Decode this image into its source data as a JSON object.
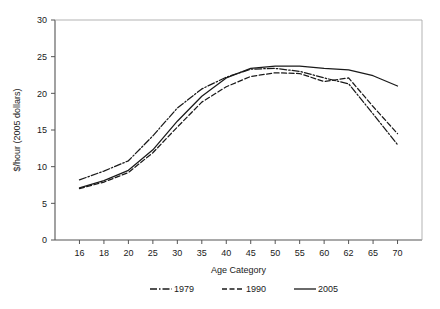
{
  "chart_data": {
    "type": "line",
    "title": "",
    "xlabel": "Age Category",
    "ylabel": "$/hour (2005 dollars)",
    "categories": [
      "16",
      "18",
      "20",
      "25",
      "30",
      "35",
      "40",
      "45",
      "50",
      "55",
      "60",
      "62",
      "65",
      "70"
    ],
    "ylim": [
      0,
      30
    ],
    "yticks": [
      "0",
      "5",
      "10",
      "15",
      "20",
      "25",
      "30"
    ],
    "grid": false,
    "legend_position": "bottom",
    "series": [
      {
        "name": "1979",
        "style": "dash-dot",
        "color": "#1a1a1a",
        "values": [
          8.2,
          9.4,
          10.8,
          14.2,
          18.0,
          20.6,
          22.2,
          23.3,
          23.4,
          23.0,
          22.1,
          21.3,
          17.2,
          13.0
        ]
      },
      {
        "name": "1990",
        "style": "dashed",
        "color": "#1a1a1a",
        "values": [
          7.0,
          7.9,
          9.2,
          11.9,
          15.4,
          18.8,
          20.9,
          22.3,
          22.8,
          22.7,
          21.6,
          22.1,
          18.2,
          14.5
        ]
      },
      {
        "name": "2005",
        "style": "solid",
        "color": "#1a1a1a",
        "values": [
          7.1,
          8.1,
          9.5,
          12.3,
          16.2,
          19.6,
          22.1,
          23.4,
          23.7,
          23.7,
          23.4,
          23.2,
          22.4,
          21.0
        ]
      }
    ]
  },
  "legend": {
    "items": [
      {
        "label": "1979"
      },
      {
        "label": "1990"
      },
      {
        "label": "2005"
      }
    ]
  }
}
